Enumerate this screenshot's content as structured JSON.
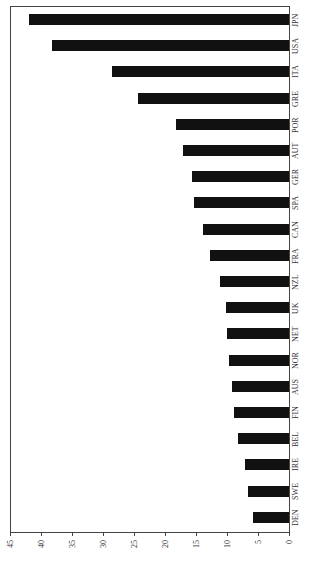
{
  "chart_data": {
    "type": "bar",
    "orientation": "horizontal (rotated 90°)",
    "title": "",
    "xlabel": "",
    "ylabel": "",
    "categories": [
      "JPN",
      "USA",
      "ITA",
      "GRE",
      "POR",
      "AUT",
      "GER",
      "SPA",
      "CAN",
      "FRA",
      "NZL",
      "UK",
      "NET",
      "NOR",
      "AUS",
      "FIN",
      "BEL",
      "IRE",
      "SWE",
      "DEN"
    ],
    "values": [
      42.0,
      38.2,
      28.6,
      24.3,
      18.3,
      17.1,
      15.7,
      15.4,
      13.8,
      12.7,
      11.2,
      10.2,
      10.0,
      9.7,
      9.2,
      8.8,
      8.3,
      7.1,
      6.6,
      5.8
    ],
    "ticks": [
      "0",
      "5",
      "10",
      "15",
      "20",
      "25",
      "30",
      "35",
      "40",
      "45"
    ],
    "ylim": [
      0,
      45
    ],
    "grid": false,
    "legend": "none",
    "bar_color": "#111111"
  }
}
